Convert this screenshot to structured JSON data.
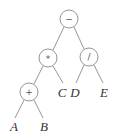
{
  "diagram": {
    "type": "expression-tree",
    "colors": {
      "stroke": "#8a8a8a",
      "text": "#333333",
      "background": "#ffffff"
    },
    "nodes": [
      {
        "id": "root",
        "label": "−",
        "kind": "operator",
        "x": 69,
        "y": 19
      },
      {
        "id": "mul",
        "label": "*",
        "kind": "operator",
        "x": 48,
        "y": 58
      },
      {
        "id": "div",
        "label": "/",
        "kind": "operator",
        "x": 89,
        "y": 57
      },
      {
        "id": "add",
        "label": "+",
        "kind": "operator",
        "x": 29,
        "y": 92
      },
      {
        "id": "C",
        "label": "C",
        "kind": "operand",
        "x": 62,
        "y": 96
      },
      {
        "id": "D",
        "label": "D",
        "kind": "operand",
        "x": 74,
        "y": 96
      },
      {
        "id": "E",
        "label": "E",
        "kind": "operand",
        "x": 104,
        "y": 96
      },
      {
        "id": "A",
        "label": "A",
        "kind": "operand",
        "x": 14,
        "y": 130
      },
      {
        "id": "B",
        "label": "B",
        "kind": "operand",
        "x": 44,
        "y": 130
      }
    ],
    "edges": [
      {
        "from": "root",
        "to": "mul"
      },
      {
        "from": "root",
        "to": "div"
      },
      {
        "from": "mul",
        "to": "add"
      },
      {
        "from": "mul",
        "to": "C"
      },
      {
        "from": "div",
        "to": "D"
      },
      {
        "from": "div",
        "to": "E"
      },
      {
        "from": "add",
        "to": "A"
      },
      {
        "from": "add",
        "to": "B"
      }
    ]
  }
}
